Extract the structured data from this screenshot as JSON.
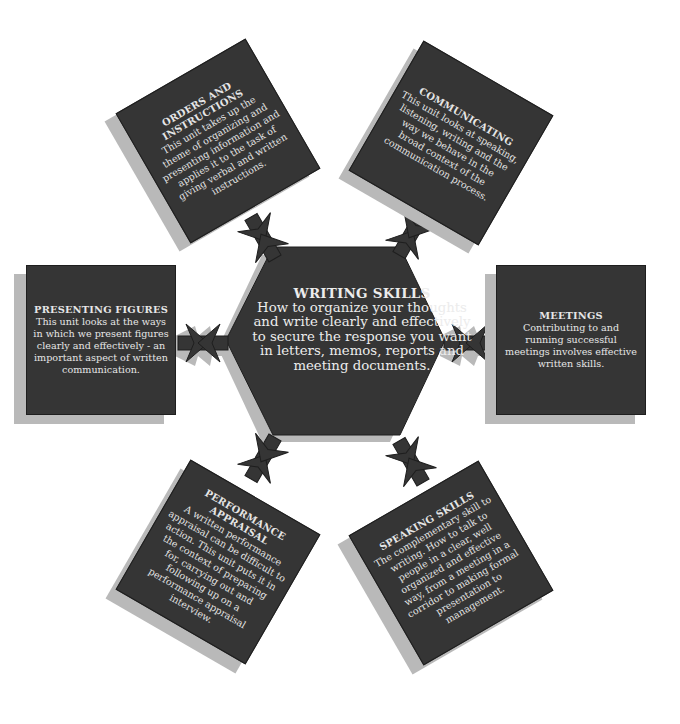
{
  "center": {
    "title": "WRITING SKILLS",
    "body": "How to organize your thoughts and write clearly and effectively to secure the response you want in letters, memos, reports and meeting documents."
  },
  "units": [
    {
      "id": "orders",
      "title": "ORDERS AND INSTRUCTIONS",
      "body": "This unit takes up the theme of organizing and presenting information and applies it to the task of giving verbal and written instructions."
    },
    {
      "id": "communicating",
      "title": "COMMUNICATING",
      "body": "This unit looks at speaking, listening, writing and the way we behave in the broad context of the communication process."
    },
    {
      "id": "presenting",
      "title": "PRESENTING FIGURES",
      "body": "This unit looks at the ways in which we present figures clearly and effectively - an important aspect of written communication."
    },
    {
      "id": "meetings",
      "title": "MEETINGS",
      "body": "Contributing to and running successful meetings involves effective written skills."
    },
    {
      "id": "appraisal",
      "title": "PERFORMANCE APPRAISAL",
      "body": "A written performance appraisal can be difficult to action. This unit puts it in the context of preparing for, carrying out and following up on a performance appraisal interview."
    },
    {
      "id": "speaking",
      "title": "SPEAKING SKILLS",
      "body": "The complementary skill to writing. How to talk to people in a clear, well organized and effective way, from a meeting in a corridor to making formal presentation to management."
    }
  ],
  "colors": {
    "box_fill": "#353535",
    "shadow": "#b9b9b9",
    "text": "#e6e6e6",
    "background": "#ffffff"
  }
}
